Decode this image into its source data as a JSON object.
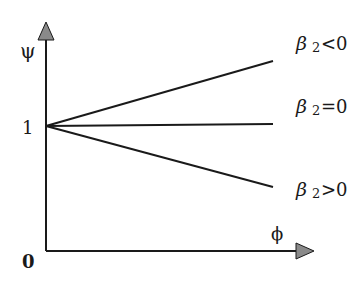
{
  "diagram": {
    "y_axis_label": "ψ",
    "x_axis_label": "ϕ",
    "origin_label": "0",
    "y_tick_label": "1",
    "lines": [
      {
        "name": "beta2-negative",
        "symbol": "β",
        "subscript": "2",
        "relation": "<0",
        "slope": "increasing"
      },
      {
        "name": "beta2-zero",
        "symbol": "β",
        "subscript": "2",
        "relation": "=0",
        "slope": "flat"
      },
      {
        "name": "beta2-positive",
        "symbol": "β",
        "subscript": "2",
        "relation": ">0",
        "slope": "decreasing"
      }
    ],
    "colors": {
      "stroke": "#1a1a1a",
      "arrowhead": "#8a8a8a"
    }
  }
}
